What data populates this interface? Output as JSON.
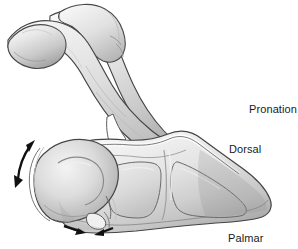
{
  "figure": {
    "style": "grayscale medical line illustration with shading",
    "background_color": "#ffffff",
    "width": 298,
    "height": 249
  },
  "labels": {
    "pronation": "Pronation",
    "dorsal": "Dorsal",
    "palmar": "Palmar"
  },
  "annotations": {
    "rotation_arrow": {
      "name": "curved-double-headed-arrow",
      "description": "curved double-headed arrow on left margin indicating rotation of the ulnar head",
      "color": "#111111"
    },
    "compression_arrows": {
      "name": "converging-arrow-pair",
      "description": "two short straight arrows at palmar margin pointing toward each other",
      "color": "#111111",
      "count": 2
    }
  },
  "colors": {
    "outline": "#3a3a3a",
    "bone_light": "#f2f2f2",
    "bone_mid": "#d8d8d8",
    "bone_shadow": "#a8a8a8",
    "bone_deep_shadow": "#8a8a8a",
    "arrow": "#111111",
    "text": "#1a1a1a",
    "background": "#ffffff"
  },
  "structures": [
    {
      "name": "proximal-shaft-upper",
      "description": "upper bone shaft running diagonally from upper-left"
    },
    {
      "name": "proximal-shaft-lower",
      "description": "second overlapping bone shaft crossing beneath"
    },
    {
      "name": "ulnar-head",
      "description": "rounded ulnar head at lower left"
    },
    {
      "name": "articular-facet-proximal",
      "description": "left articular facet of distal bone"
    },
    {
      "name": "articular-facet-distal",
      "description": "right articular facet of distal bone"
    },
    {
      "name": "interosseous-gap",
      "description": "white triangular gap between crossing shafts"
    },
    {
      "name": "styloid-process",
      "description": "small projection at lower margin near arrows"
    }
  ]
}
